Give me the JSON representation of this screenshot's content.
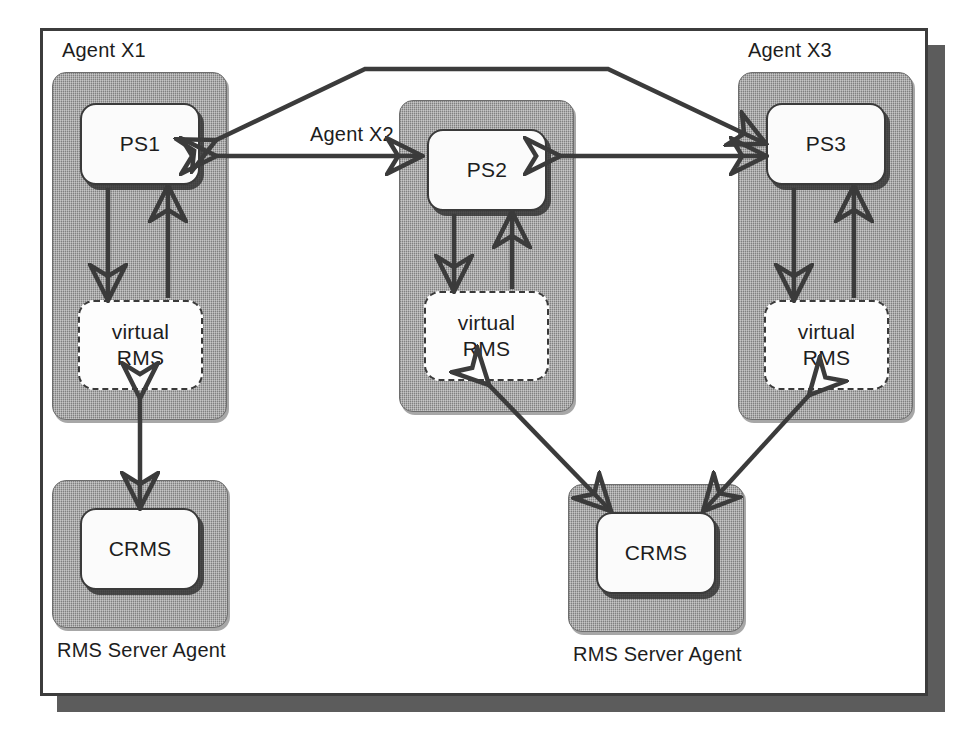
{
  "diagram": {
    "colors": {
      "agent_container_gray": "#9c9c9c",
      "node_fill": "#fbfbfb",
      "stroke": "#3b3b3b",
      "frame_border": "#3c3c3c",
      "frame_shadow": "#5c5c5c",
      "page_background": "#ffffff"
    },
    "agents": [
      {
        "id": "agent-x1",
        "label": "Agent X1",
        "nodes": [
          {
            "id": "ps1",
            "label": "PS1",
            "style": "solid"
          },
          {
            "id": "virtual-rms-1",
            "label_line1": "virtual",
            "label_line2": "RMS",
            "style": "dashed"
          }
        ]
      },
      {
        "id": "agent-x2",
        "label": "Agent X2",
        "nodes": [
          {
            "id": "ps2",
            "label": "PS2",
            "style": "solid"
          },
          {
            "id": "virtual-rms-2",
            "label_line1": "virtual",
            "label_line2": "RMS",
            "style": "dashed"
          }
        ]
      },
      {
        "id": "agent-x3",
        "label": "Agent X3",
        "nodes": [
          {
            "id": "ps3",
            "label": "PS3",
            "style": "solid"
          },
          {
            "id": "virtual-rms-3",
            "label_line1": "virtual",
            "label_line2": "RMS",
            "style": "dashed"
          }
        ]
      },
      {
        "id": "rms-server-agent-left",
        "label": "RMS Server Agent",
        "nodes": [
          {
            "id": "crms-left",
            "label": "CRMS",
            "style": "solid"
          }
        ]
      },
      {
        "id": "rms-server-agent-right",
        "label": "RMS Server Agent",
        "nodes": [
          {
            "id": "crms-right",
            "label": "CRMS",
            "style": "solid"
          }
        ]
      }
    ],
    "connections": [
      {
        "id": "ps1-ps3-arc",
        "from": "ps1",
        "to": "ps3",
        "direction": "bidirectional",
        "shape": "arc-over"
      },
      {
        "id": "ps1-ps2",
        "from": "ps1",
        "to": "ps2",
        "direction": "bidirectional",
        "shape": "horizontal"
      },
      {
        "id": "ps2-ps3",
        "from": "ps2",
        "to": "ps3",
        "direction": "bidirectional",
        "shape": "horizontal"
      },
      {
        "id": "ps1-vrms1-down",
        "from": "ps1",
        "to": "virtual-rms-1",
        "direction": "forward",
        "shape": "vertical"
      },
      {
        "id": "vrms1-ps1-up",
        "from": "virtual-rms-1",
        "to": "ps1",
        "direction": "forward",
        "shape": "vertical"
      },
      {
        "id": "ps2-vrms2-down",
        "from": "ps2",
        "to": "virtual-rms-2",
        "direction": "forward",
        "shape": "vertical"
      },
      {
        "id": "vrms2-ps2-up",
        "from": "virtual-rms-2",
        "to": "ps2",
        "direction": "forward",
        "shape": "vertical"
      },
      {
        "id": "ps3-vrms3-down",
        "from": "ps3",
        "to": "virtual-rms-3",
        "direction": "forward",
        "shape": "vertical"
      },
      {
        "id": "vrms3-ps3-up",
        "from": "virtual-rms-3",
        "to": "ps3",
        "direction": "forward",
        "shape": "vertical"
      },
      {
        "id": "vrms1-crmsleft",
        "from": "virtual-rms-1",
        "to": "crms-left",
        "direction": "bidirectional",
        "shape": "vertical"
      },
      {
        "id": "vrms2-crmsright",
        "from": "virtual-rms-2",
        "to": "crms-right",
        "direction": "bidirectional",
        "shape": "diagonal"
      },
      {
        "id": "vrms3-crmsright",
        "from": "virtual-rms-3",
        "to": "crms-right",
        "direction": "bidirectional",
        "shape": "diagonal"
      }
    ]
  }
}
